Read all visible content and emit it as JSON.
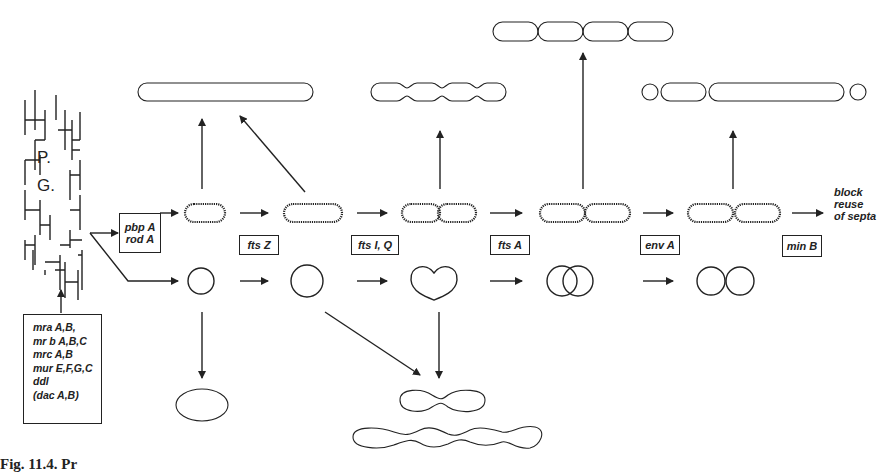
{
  "diagram": {
    "peptidoglycan_label_1": "P.",
    "peptidoglycan_label_2": "G.",
    "synthesis_genes": [
      "mra A,B,",
      "mr b A,B,C",
      "mrc A,B",
      "mur E,F,G,C",
      "ddl",
      "(dac A,B)"
    ],
    "shape_genes": [
      "pbp A",
      "rod A"
    ],
    "division_steps": [
      {
        "gene": "fts Z"
      },
      {
        "gene": "fts I, Q"
      },
      {
        "gene": "fts A"
      },
      {
        "gene": "env A"
      },
      {
        "gene": "min B"
      }
    ],
    "end_label": [
      "block",
      "reuse",
      "of septa"
    ],
    "caption": "Fig. 11.4. Pr"
  }
}
